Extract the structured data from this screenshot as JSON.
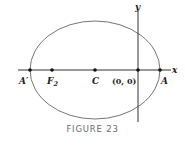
{
  "figure": {
    "caption": "FIGURE 23",
    "axes": {
      "x_label": "x",
      "y_label": "y"
    },
    "points": [
      {
        "id": "A-prime",
        "label": "A′"
      },
      {
        "id": "F2",
        "label": "F",
        "sub": "2"
      },
      {
        "id": "C",
        "label": "C"
      },
      {
        "id": "origin",
        "label": "(0, 0)"
      },
      {
        "id": "A",
        "label": "A"
      }
    ],
    "colors": {
      "ellipse": "#666666",
      "axes": "#333333",
      "points": "#111111",
      "caption": "#6b6b6b"
    }
  }
}
